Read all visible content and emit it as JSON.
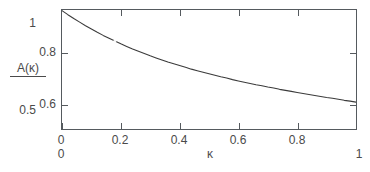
{
  "chart_data": {
    "type": "line",
    "title": "",
    "subtitle": "",
    "xlabel": "κ",
    "ylabel": "A(κ)",
    "xlim": [
      0,
      1
    ],
    "ylim": [
      0.5,
      0.9654
    ],
    "grid": false,
    "legend": null,
    "annotations": [],
    "x_ticks": [
      {
        "value": 0,
        "label": "0"
      },
      {
        "value": 0.2,
        "label": "0.2"
      },
      {
        "value": 0.4,
        "label": "0.4"
      },
      {
        "value": 0.6,
        "label": "0.6"
      },
      {
        "value": 0.8,
        "label": "0.8"
      }
    ],
    "x_ticks_outer": [
      {
        "value": 0,
        "label": "0"
      },
      {
        "value": 1,
        "label": "1"
      }
    ],
    "y_ticks": [
      {
        "value": 0.8,
        "label": "0.8"
      },
      {
        "value": 0.6,
        "label": "0.6"
      }
    ],
    "y_ticks_outer": [
      {
        "value": 0.9654,
        "label": "1"
      },
      {
        "value": 0.5769,
        "label": "0.5"
      }
    ],
    "series": [
      {
        "name": "A(κ)",
        "color": "#3b3b3b",
        "x": [
          0.0,
          0.02,
          0.04,
          0.06,
          0.08,
          0.1,
          0.12,
          0.14,
          0.16,
          0.18,
          0.2,
          0.22,
          0.24,
          0.26,
          0.28,
          0.3,
          0.32,
          0.34,
          0.36,
          0.38,
          0.4,
          0.42,
          0.44,
          0.46,
          0.48,
          0.5,
          0.52,
          0.54,
          0.56,
          0.58,
          0.6,
          0.62,
          0.64,
          0.66,
          0.68,
          0.7,
          0.72,
          0.74,
          0.76,
          0.78,
          0.8,
          0.82,
          0.84,
          0.86,
          0.88,
          0.9,
          0.92,
          0.94,
          0.96,
          0.98,
          1.0
        ],
        "y": [
          0.965,
          0.949,
          0.934,
          0.92,
          0.906,
          0.893,
          0.88,
          0.868,
          0.857,
          0.846,
          0.835,
          0.825,
          0.815,
          0.806,
          0.797,
          0.788,
          0.78,
          0.772,
          0.764,
          0.757,
          0.75,
          0.743,
          0.736,
          0.73,
          0.724,
          0.718,
          0.712,
          0.706,
          0.701,
          0.695,
          0.69,
          0.685,
          0.68,
          0.675,
          0.671,
          0.666,
          0.662,
          0.657,
          0.653,
          0.649,
          0.645,
          0.641,
          0.637,
          0.633,
          0.629,
          0.625,
          0.622,
          0.618,
          0.614,
          0.611,
          0.607
        ]
      }
    ]
  }
}
